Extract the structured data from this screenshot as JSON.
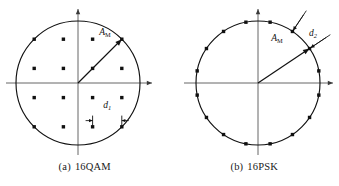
{
  "figure": {
    "background_color": "#ffffff",
    "ink_color": "#111111",
    "axis_color": "#555555",
    "panels": [
      {
        "id": "panel-16qam",
        "caption_tag": "(a)",
        "caption_label": "16QAM",
        "modulation": "16QAM",
        "center": {
          "x": 78,
          "y": 83
        },
        "circle_radius": 62,
        "axis": {
          "x_left": -72,
          "x_right": 74,
          "y_top": -74,
          "y_bottom": 72,
          "x_arrow": "right",
          "y_arrow": "up"
        },
        "grid_spacing": 29.2,
        "point_radius": 1.7,
        "points": [
          {
            "i": -1.5,
            "q": 1.5
          },
          {
            "i": -0.5,
            "q": 1.5
          },
          {
            "i": 0.5,
            "q": 1.5
          },
          {
            "i": 1.5,
            "q": 1.5
          },
          {
            "i": -1.5,
            "q": 0.5
          },
          {
            "i": -0.5,
            "q": 0.5
          },
          {
            "i": 0.5,
            "q": 0.5
          },
          {
            "i": 1.5,
            "q": 0.5
          },
          {
            "i": -1.5,
            "q": -0.5
          },
          {
            "i": -0.5,
            "q": -0.5
          },
          {
            "i": 0.5,
            "q": -0.5
          },
          {
            "i": 1.5,
            "q": -0.5
          },
          {
            "i": -1.5,
            "q": -1.5
          },
          {
            "i": -0.5,
            "q": -1.5
          },
          {
            "i": 0.5,
            "q": -1.5
          },
          {
            "i": 1.5,
            "q": -1.5
          }
        ],
        "vector": {
          "label_base": "A",
          "label_sub": "M",
          "target": {
            "i": 1.5,
            "q": 1.5
          },
          "label_x": 27,
          "label_y": -48
        },
        "dimension": {
          "label_base": "d",
          "label_sub": "1",
          "from_i": 0.5,
          "from_q": -0.5,
          "to_i": 1.5,
          "to_q": -0.5,
          "y_offset": 23,
          "tick_half_height": 5,
          "label_x": 29.2,
          "label_y": 25
        }
      },
      {
        "id": "panel-16psk",
        "caption_tag": "(b)",
        "caption_label": "16PSK",
        "modulation": "16PSK",
        "center": {
          "x": 258,
          "y": 83
        },
        "circle_radius": 62,
        "axis": {
          "x_left": -74,
          "x_right": 75,
          "y_top": -74,
          "y_bottom": 72,
          "x_arrow": "right",
          "y_arrow": "up"
        },
        "point_radius": 1.7,
        "num_points": 16,
        "angle_offset_deg": 11.25,
        "angle_step_deg": 22.5,
        "vector": {
          "label_base": "A",
          "label_sub": "M",
          "target_angle_deg": 33.75,
          "label_x": 19,
          "label_y": -42
        },
        "dimension": {
          "label_base": "d",
          "label_sub": "2",
          "angle_a_deg": 56.25,
          "angle_b_deg": 33.75,
          "tick_inner": 2,
          "tick_outer": 20,
          "label_x": 55,
          "label_y": -47
        }
      }
    ]
  }
}
